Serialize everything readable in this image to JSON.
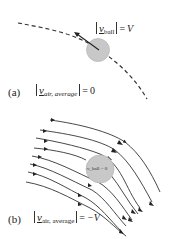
{
  "figure_a": {
    "panel_label": "(a)",
    "ball_speed_label": {
      "symbol": "v",
      "subscript": "ball",
      "equals": "=",
      "value": "V"
    },
    "air_speed_label": {
      "symbol": "v",
      "subscript": "air, average",
      "equals": "=",
      "value": "0"
    },
    "colors": {
      "ball": "#c8c8c8",
      "ball_stroke": "#a8a8a8",
      "path": "#333333"
    }
  },
  "figure_b": {
    "panel_label": "(b)",
    "ball_label": "v_ball = 0",
    "air_speed_label": {
      "symbol": "v",
      "subscript": "air, average",
      "equals": "=",
      "value": "−V"
    },
    "streamline_count": 8,
    "colors": {
      "ball": "#c8c8c8",
      "ball_stroke": "#a8a8a8",
      "streamline": "#333333"
    }
  }
}
